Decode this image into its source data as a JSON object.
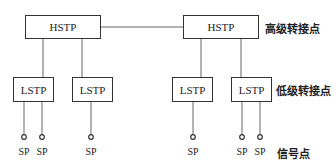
{
  "diagram": {
    "title": "",
    "hstp_nodes": [
      {
        "label": "HSTP"
      },
      {
        "label": "HSTP"
      }
    ],
    "lstp_nodes": [
      {
        "label": "LSTP"
      },
      {
        "label": "LSTP"
      },
      {
        "label": "LSTP"
      },
      {
        "label": "LSTP"
      }
    ],
    "sp_nodes": [
      {
        "label": "SP"
      },
      {
        "label": "SP"
      },
      {
        "label": "SP"
      },
      {
        "label": "SP"
      },
      {
        "label": "SP"
      },
      {
        "label": "SP"
      }
    ],
    "legend": {
      "high_level": "高级转接点",
      "low_level": "低级转接点",
      "signal_point": "信号点"
    },
    "colors": {
      "line": "#555555",
      "box_border": "#333333"
    }
  }
}
